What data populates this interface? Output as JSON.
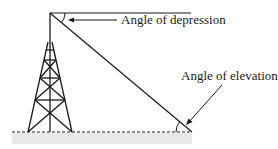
{
  "diagram": {
    "labels": {
      "depression": "Angle of depression",
      "elevation": "Angle of elevation"
    },
    "colors": {
      "line": "#1a1a1a",
      "ground_band": "#e6e6e6"
    }
  }
}
